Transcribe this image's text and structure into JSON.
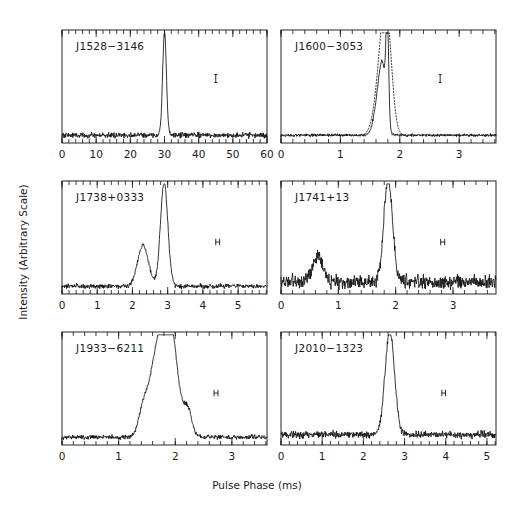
{
  "figure": {
    "xlabel": "Pulse Phase (ms)",
    "ylabel": "Intensity (Arbitrary Scale)",
    "background": "#ffffff",
    "ink_color": "#111111"
  },
  "chart_data": {
    "type": "line",
    "title": "",
    "xlabel": "Pulse Phase (ms)",
    "ylabel": "Intensity (Arbitrary Scale)",
    "grid": false,
    "legend": "none",
    "layout": {
      "rows": 3,
      "cols": 2,
      "shared_xlabel": true,
      "shared_ylabel": true
    },
    "panels": [
      {
        "name": "J1528-3146",
        "label": "J1528−3146",
        "row": 0,
        "col": 0,
        "xlim": [
          0,
          60
        ],
        "xticks": [
          0,
          10,
          20,
          30,
          40,
          50,
          60
        ],
        "xtick_labels": [
          "0",
          "10",
          "20",
          "30",
          "40",
          "50",
          "60"
        ],
        "minor_tick_step": 2,
        "ylim": [
          0,
          1
        ],
        "yticks": [],
        "resolution_bar": {
          "x_center": 45.0,
          "half_width": 0.45,
          "y": 0.62,
          "shape": "vertical-tick"
        },
        "series": [
          {
            "name": "profile",
            "style": "solid",
            "peaks": [
              {
                "phase": 30.0,
                "height": 1.0,
                "width": 0.55
              }
            ],
            "baseline": 0.075,
            "noise_amplitude": 0.022
          }
        ]
      },
      {
        "name": "J1600-3053",
        "label": "J1600−3053",
        "row": 0,
        "col": 1,
        "xlim": [
          0,
          3.62
        ],
        "xticks": [
          0,
          1,
          2,
          3
        ],
        "xtick_labels": [
          "0",
          "1",
          "2",
          "3"
        ],
        "minor_tick_step": 0.2,
        "ylim": [
          0,
          1
        ],
        "yticks": [],
        "resolution_bar": {
          "x_center": 2.68,
          "half_width": 0.022,
          "y": 0.62,
          "shape": "vertical-tick"
        },
        "series": [
          {
            "name": "profile",
            "style": "solid",
            "peaks": [
              {
                "phase": 1.79,
                "height": 1.0,
                "width": 0.022
              },
              {
                "phase": 1.66,
                "height": 0.44,
                "width": 0.075
              },
              {
                "phase": 1.72,
                "height": 0.36,
                "width": 0.05
              }
            ],
            "baseline": 0.075,
            "noise_amplitude": 0.012
          },
          {
            "name": "profile-comparison",
            "style": "dotted",
            "peaks": [
              {
                "phase": 1.78,
                "height": 0.93,
                "width": 0.085
              },
              {
                "phase": 1.68,
                "height": 0.52,
                "width": 0.1
              }
            ],
            "baseline": 0.075,
            "noise_amplitude": 0.0
          }
        ]
      },
      {
        "name": "J1738+0333",
        "label": "J1738+0333",
        "row": 1,
        "col": 0,
        "xlim": [
          0,
          5.82
        ],
        "xticks": [
          0,
          1,
          2,
          3,
          4,
          5
        ],
        "xtick_labels": [
          "0",
          "1",
          "2",
          "3",
          "4",
          "5"
        ],
        "minor_tick_step": 0.2,
        "ylim": [
          0,
          1
        ],
        "yticks": [],
        "resolution_bar": {
          "x_center": 4.42,
          "half_width": 0.055,
          "y": 0.5,
          "shape": "h-bar"
        },
        "series": [
          {
            "name": "profile",
            "style": "solid",
            "peaks": [
              {
                "phase": 2.9,
                "height": 1.0,
                "width": 0.105
              },
              {
                "phase": 2.3,
                "height": 0.39,
                "width": 0.155
              }
            ],
            "baseline": 0.075,
            "noise_amplitude": 0.018
          }
        ]
      },
      {
        "name": "J1741+13",
        "label": "J1741+13",
        "row": 1,
        "col": 1,
        "xlim": [
          0,
          3.75
        ],
        "xticks": [
          0,
          1,
          2,
          3
        ],
        "xtick_labels": [
          "0",
          "1",
          "2",
          "3"
        ],
        "minor_tick_step": 0.2,
        "ylim": [
          0,
          1
        ],
        "yticks": [],
        "resolution_bar": {
          "x_center": 2.82,
          "half_width": 0.035,
          "y": 0.5,
          "shape": "h-bar"
        },
        "series": [
          {
            "name": "profile",
            "style": "solid",
            "peaks": [
              {
                "phase": 1.87,
                "height": 1.0,
                "width": 0.075
              },
              {
                "phase": 0.64,
                "height": 0.26,
                "width": 0.09
              }
            ],
            "baseline": 0.115,
            "noise_amplitude": 0.055
          }
        ]
      },
      {
        "name": "J1933-6211",
        "label": "J1933−6211",
        "row": 2,
        "col": 0,
        "xlim": [
          0,
          3.62
        ],
        "xticks": [
          0,
          1,
          2,
          3
        ],
        "xtick_labels": [
          "0",
          "1",
          "2",
          "3"
        ],
        "minor_tick_step": 0.2,
        "ylim": [
          0,
          1
        ],
        "yticks": [],
        "resolution_bar": {
          "x_center": 2.72,
          "half_width": 0.035,
          "y": 0.5,
          "shape": "h-bar"
        },
        "series": [
          {
            "name": "profile",
            "style": "solid",
            "peaks": [
              {
                "phase": 1.74,
                "height": 1.0,
                "width": 0.165
              },
              {
                "phase": 1.96,
                "height": 0.6,
                "width": 0.105
              },
              {
                "phase": 2.22,
                "height": 0.26,
                "width": 0.075
              },
              {
                "phase": 1.43,
                "height": 0.19,
                "width": 0.075
              }
            ],
            "baseline": 0.075,
            "noise_amplitude": 0.018
          }
        ]
      },
      {
        "name": "J2010-1323",
        "label": "J2010−1323",
        "row": 2,
        "col": 1,
        "xlim": [
          0,
          5.22
        ],
        "xticks": [
          0,
          1,
          2,
          3,
          4,
          5
        ],
        "xtick_labels": [
          "0",
          "1",
          "2",
          "3",
          "4",
          "5"
        ],
        "minor_tick_step": 0.2,
        "ylim": [
          0,
          1
        ],
        "yticks": [],
        "resolution_bar": {
          "x_center": 3.95,
          "half_width": 0.045,
          "y": 0.5,
          "shape": "h-bar"
        },
        "series": [
          {
            "name": "profile",
            "style": "solid",
            "peaks": [
              {
                "phase": 2.64,
                "height": 1.0,
                "width": 0.115
              }
            ],
            "baseline": 0.1,
            "noise_amplitude": 0.03
          }
        ]
      }
    ]
  }
}
